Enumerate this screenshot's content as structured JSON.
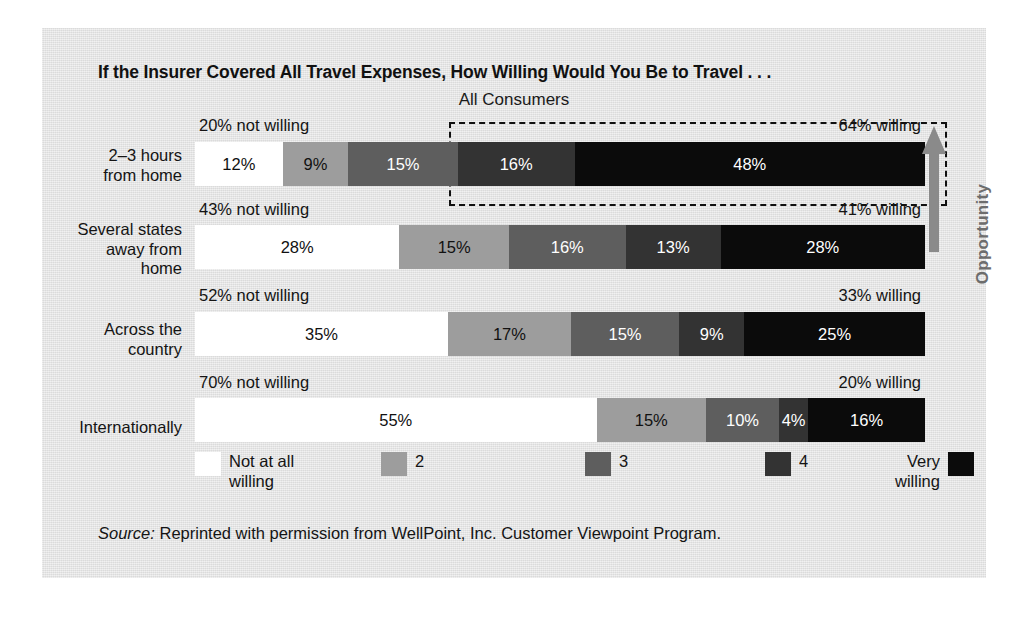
{
  "title": "If the Insurer Covered All Travel Expenses, How Willing Would You Be to Travel . . .",
  "subtitle": "All Consumers",
  "source": {
    "label": "Source:",
    "text": " Reprinted with permission from WellPoint, Inc. Customer Viewpoint Program."
  },
  "annotation": {
    "opportunity_label": "Opportunity",
    "arrow_icon": "up-arrow-icon"
  },
  "legend": {
    "items": [
      {
        "label": "Not at all\nwilling",
        "color": "#ffffff",
        "swatch_side": "left"
      },
      {
        "label": "2",
        "color": "#9d9d9d",
        "swatch_side": "left"
      },
      {
        "label": "3",
        "color": "#5e5e5e",
        "swatch_side": "left"
      },
      {
        "label": "4",
        "color": "#333333",
        "swatch_side": "left"
      },
      {
        "label": "Very\nwilling",
        "color": "#0b0b0b",
        "swatch_side": "right"
      }
    ]
  },
  "chart_data": {
    "type": "bar",
    "orientation": "horizontal",
    "stacked": true,
    "normalized_percent": true,
    "title": "If the Insurer Covered All Travel Expenses, How Willing Would You Be to Travel . . .",
    "subtitle": "All Consumers",
    "xlabel": "",
    "ylabel": "",
    "xlim": [
      0,
      100
    ],
    "grid": false,
    "legend_position": "bottom",
    "series": [
      {
        "name": "Not at all willing",
        "color": "#ffffff",
        "values": [
          12,
          28,
          35,
          55
        ]
      },
      {
        "name": "2",
        "color": "#9d9d9d",
        "values": [
          9,
          15,
          17,
          15
        ]
      },
      {
        "name": "3",
        "color": "#5e5e5e",
        "values": [
          15,
          16,
          15,
          10
        ]
      },
      {
        "name": "4",
        "color": "#333333",
        "values": [
          16,
          13,
          9,
          4
        ]
      },
      {
        "name": "Very willing",
        "color": "#0b0b0b",
        "values": [
          48,
          28,
          25,
          16
        ]
      }
    ],
    "categories": [
      "2–3 hours from home",
      "Several states away from home",
      "Across the country",
      "Internationally"
    ],
    "rows": [
      {
        "label": "2–3 hours\nfrom home",
        "not_willing": "20% not willing",
        "willing": "64% willing",
        "segments": [
          {
            "name": "Not at all willing",
            "value": 12,
            "label": "12%",
            "color": "#ffffff",
            "text_color": "#111111"
          },
          {
            "name": "2",
            "value": 9,
            "label": "9%",
            "color": "#9d9d9d",
            "text_color": "#111111"
          },
          {
            "name": "3",
            "value": 15,
            "label": "15%",
            "color": "#5e5e5e",
            "text_color": "#ffffff"
          },
          {
            "name": "4",
            "value": 16,
            "label": "16%",
            "color": "#333333",
            "text_color": "#ffffff"
          },
          {
            "name": "Very willing",
            "value": 48,
            "label": "48%",
            "color": "#0b0b0b",
            "text_color": "#ffffff"
          }
        ]
      },
      {
        "label": "Several states\naway from\nhome",
        "not_willing": "43% not willing",
        "willing": "41% willing",
        "segments": [
          {
            "name": "Not at all willing",
            "value": 28,
            "label": "28%",
            "color": "#ffffff",
            "text_color": "#111111"
          },
          {
            "name": "2",
            "value": 15,
            "label": "15%",
            "color": "#9d9d9d",
            "text_color": "#111111"
          },
          {
            "name": "3",
            "value": 16,
            "label": "16%",
            "color": "#5e5e5e",
            "text_color": "#ffffff"
          },
          {
            "name": "4",
            "value": 13,
            "label": "13%",
            "color": "#333333",
            "text_color": "#ffffff"
          },
          {
            "name": "Very willing",
            "value": 28,
            "label": "28%",
            "color": "#0b0b0b",
            "text_color": "#ffffff"
          }
        ]
      },
      {
        "label": "Across the\ncountry",
        "not_willing": "52% not willing",
        "willing": "33% willing",
        "segments": [
          {
            "name": "Not at all willing",
            "value": 35,
            "label": "35%",
            "color": "#ffffff",
            "text_color": "#111111"
          },
          {
            "name": "2",
            "value": 17,
            "label": "17%",
            "color": "#9d9d9d",
            "text_color": "#111111"
          },
          {
            "name": "3",
            "value": 15,
            "label": "15%",
            "color": "#5e5e5e",
            "text_color": "#ffffff"
          },
          {
            "name": "4",
            "value": 9,
            "label": "9%",
            "color": "#333333",
            "text_color": "#ffffff"
          },
          {
            "name": "Very willing",
            "value": 25,
            "label": "25%",
            "color": "#0b0b0b",
            "text_color": "#ffffff"
          }
        ]
      },
      {
        "label": "Internationally",
        "not_willing": "70% not willing",
        "willing": "20% willing",
        "segments": [
          {
            "name": "Not at all willing",
            "value": 55,
            "label": "55%",
            "color": "#ffffff",
            "text_color": "#111111"
          },
          {
            "name": "2",
            "value": 15,
            "label": "15%",
            "color": "#9d9d9d",
            "text_color": "#111111"
          },
          {
            "name": "3",
            "value": 10,
            "label": "10%",
            "color": "#5e5e5e",
            "text_color": "#ffffff"
          },
          {
            "name": "4",
            "value": 4,
            "label": "4%",
            "color": "#333333",
            "text_color": "#ffffff"
          },
          {
            "name": "Very willing",
            "value": 16,
            "label": "16%",
            "color": "#0b0b0b",
            "text_color": "#ffffff"
          }
        ]
      }
    ],
    "annotations": [
      {
        "type": "dashed-box",
        "target_row": 0,
        "note": "highlights the willing portion of the 2-3 hours row"
      },
      {
        "type": "arrow",
        "direction": "up",
        "label": "Opportunity"
      }
    ]
  }
}
